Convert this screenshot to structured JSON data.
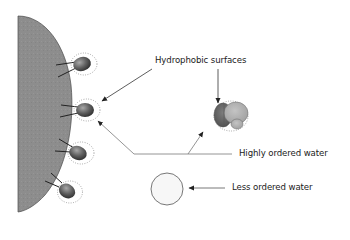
{
  "diagram": {
    "type": "hydrophobic-effect-illustration",
    "labels": {
      "hydrophobic_surfaces": "Hydrophobic surfaces",
      "highly_ordered_water": "Highly ordered water",
      "less_ordered_water": "Less ordered water"
    },
    "elements": {
      "large_body": "Gray membrane-like body with attached hydrophobic side groups",
      "side_groups_count": 4,
      "molecule_cluster": "Two-tone hydrophobic molecule cluster",
      "open_circle": "Molecule surrounded by less ordered water"
    },
    "colors": {
      "body_fill": "#8c8c8c",
      "body_edge": "#4a4a4a",
      "group_dark": "#4f4f4f",
      "group_light": "#9a9a9a",
      "cluster_dark": "#6e6e6e",
      "cluster_light": "#b5b5b5",
      "water_dots": "#8a8a8a",
      "arrow": "#333333",
      "leader_line": "#7a7a7a",
      "text": "#1a1a1a"
    }
  }
}
